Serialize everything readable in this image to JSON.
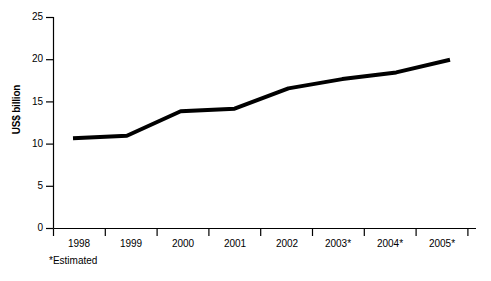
{
  "chart_data": {
    "type": "line",
    "title": "",
    "subtitle": "",
    "xlabel": "",
    "ylabel": "US$ billion",
    "categories": [
      "1998",
      "1999",
      "2000",
      "2001",
      "2002",
      "2003*",
      "2004*",
      "2005*"
    ],
    "values": [
      10.7,
      11.0,
      13.9,
      14.2,
      16.6,
      17.7,
      18.5,
      20.0
    ],
    "series": [
      {
        "name": "US$ billion",
        "values": [
          10.7,
          11.0,
          13.9,
          14.2,
          16.6,
          17.7,
          18.5,
          20.0
        ]
      }
    ],
    "ylim": [
      0,
      25
    ],
    "y_ticks": [
      0,
      5,
      10,
      15,
      20,
      25
    ],
    "y_tick_labels": [
      "0",
      "5",
      "10",
      "15",
      "20",
      "25"
    ],
    "x_tick_labels": [
      "1998",
      "1999",
      "2000",
      "2001",
      "2002",
      "2003*",
      "2004*",
      "2005*"
    ],
    "grid": false,
    "legend": false,
    "legend_position": "none",
    "annotations": [
      "*Estimated"
    ],
    "line_color": "#000000",
    "line_width": 4,
    "axis_color": "#000000",
    "background_color": "#ffffff"
  },
  "footnote": {
    "text": "*Estimated"
  },
  "axis": {
    "y_title": "US$ billion",
    "y_labels": [
      "25",
      "20",
      "15",
      "10",
      "5",
      "0"
    ],
    "x_labels": [
      "1998",
      "1999",
      "2000",
      "2001",
      "2002",
      "2003*",
      "2004*",
      "2005*"
    ]
  }
}
